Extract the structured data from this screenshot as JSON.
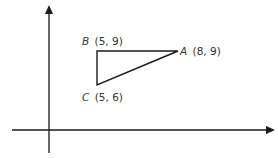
{
  "diagram": {
    "type": "coordinate-plane-triangle",
    "points": [
      {
        "name": "A",
        "coords": "(8, 9)",
        "x": 8,
        "y": 9
      },
      {
        "name": "B",
        "coords": "(5, 9)",
        "x": 5,
        "y": 9
      },
      {
        "name": "C",
        "coords": "(5, 6)",
        "x": 5,
        "y": 6
      }
    ],
    "colors": {
      "line": "#1a1a1a",
      "text": "#333333",
      "background": "#ffffff"
    }
  }
}
